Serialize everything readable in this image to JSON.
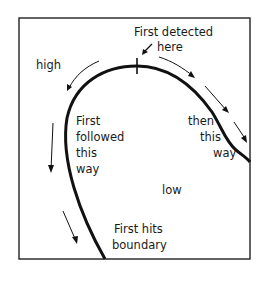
{
  "diagram": {
    "labels": {
      "first_detected": "First detected",
      "here": "here",
      "high": "high",
      "first": "First",
      "followed": "followed",
      "this1": "this",
      "way1": "way",
      "then": "then",
      "this2": "this",
      "way2": "way",
      "low": "low",
      "first_hits": "First hits",
      "boundary": "boundary"
    },
    "colors": {
      "ink": "#111111",
      "background": "#ffffff"
    }
  }
}
